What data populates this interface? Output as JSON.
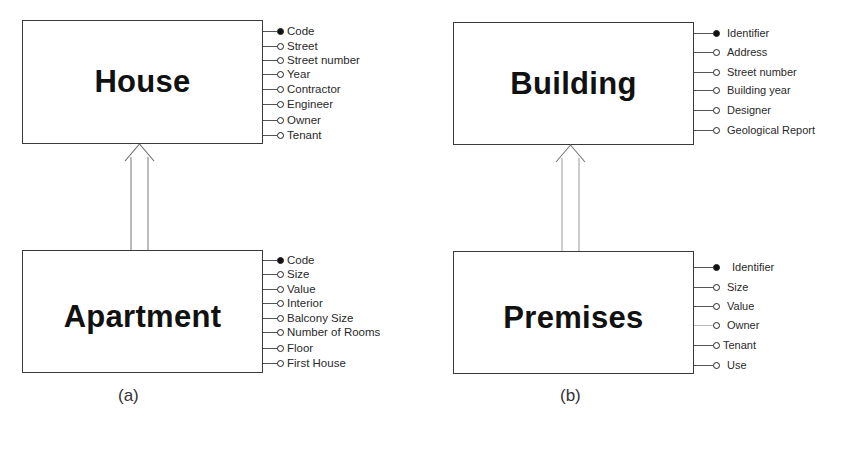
{
  "diagram_a": {
    "caption": "(a)",
    "parent": {
      "name": "House",
      "attributes": [
        {
          "label": "Code",
          "key": true
        },
        {
          "label": "Street",
          "key": false
        },
        {
          "label": "Street number",
          "key": false
        },
        {
          "label": "Year",
          "key": false
        },
        {
          "label": "Contractor",
          "key": false
        },
        {
          "label": "Engineer",
          "key": false
        },
        {
          "label": "Owner",
          "key": false
        },
        {
          "label": "Tenant",
          "key": false
        }
      ]
    },
    "child": {
      "name": "Apartment",
      "attributes": [
        {
          "label": "Code",
          "key": true
        },
        {
          "label": "Size",
          "key": false
        },
        {
          "label": "Value",
          "key": false
        },
        {
          "label": "Interior",
          "key": false
        },
        {
          "label": "Balcony Size",
          "key": false
        },
        {
          "label": "Number of Rooms",
          "key": false
        },
        {
          "label": "Floor",
          "key": false
        },
        {
          "label": "First House",
          "key": false
        }
      ]
    },
    "relationship": "generalization-arrow"
  },
  "diagram_b": {
    "caption": "(b)",
    "parent": {
      "name": "Building",
      "attributes": [
        {
          "label": "Identifier",
          "key": true
        },
        {
          "label": "Address",
          "key": false
        },
        {
          "label": "Street number",
          "key": false
        },
        {
          "label": "Building year",
          "key": false
        },
        {
          "label": "Designer",
          "key": false
        },
        {
          "label": "Geological Report",
          "key": false
        }
      ]
    },
    "child": {
      "name": "Premises",
      "attributes": [
        {
          "label": "Identifier",
          "key": true
        },
        {
          "label": "Size",
          "key": false
        },
        {
          "label": "Value",
          "key": false
        },
        {
          "label": "Owner",
          "key": false
        },
        {
          "label": "Tenant",
          "key": false
        },
        {
          "label": "Use",
          "key": false
        }
      ]
    },
    "relationship": "generalization-arrow"
  },
  "colors": {
    "line": "#3a3a3a",
    "text": "#1a1a1a",
    "background": "#ffffff"
  }
}
